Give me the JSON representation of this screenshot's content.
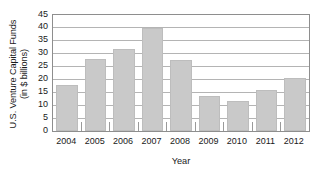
{
  "chart_data": {
    "type": "bar",
    "title": "",
    "subtitle": "",
    "xlabel": "Year",
    "ylabel": "U.S. Venture Capital Funds (in $ billions)",
    "ylabel_lines": [
      "U.S. Venture Capital Funds",
      "(in $ billions)"
    ],
    "categories": [
      "2004",
      "2005",
      "2006",
      "2007",
      "2008",
      "2009",
      "2010",
      "2011",
      "2012"
    ],
    "values": [
      18,
      28,
      32,
      40,
      27.5,
      13.5,
      11.5,
      16,
      20.5
    ],
    "series": [
      {
        "name": "U.S. Venture Capital Funds",
        "values": [
          18,
          28,
          32,
          40,
          27.5,
          13.5,
          11.5,
          16,
          20.5
        ]
      }
    ],
    "ylim": [
      0,
      45
    ],
    "xlim": [
      0,
      9
    ],
    "ytick_labels": [
      "0",
      "5",
      "10",
      "15",
      "20",
      "25",
      "30",
      "35",
      "40",
      "45"
    ],
    "ytick_values": [
      0,
      5,
      10,
      15,
      20,
      25,
      30,
      35,
      40,
      45
    ],
    "ytick_step": 5,
    "xtick_labels": [
      "2004",
      "2005",
      "2006",
      "2007",
      "2008",
      "2009",
      "2010",
      "2011",
      "2012"
    ],
    "grid": {
      "horizontal": true,
      "vertical": false,
      "color": "#b4b4b4"
    },
    "legend": {
      "visible": false,
      "position": "none",
      "entries": []
    },
    "annotations": [],
    "colors": {
      "bar_fill": "#c9c9c9",
      "bar_edge": "#bdbdbd",
      "axis": "#8e8e8e",
      "gridline": "#b4b4b4",
      "text": "#1a1a1a",
      "background": "#ffffff"
    },
    "minor_ticks_between_bars": true
  }
}
